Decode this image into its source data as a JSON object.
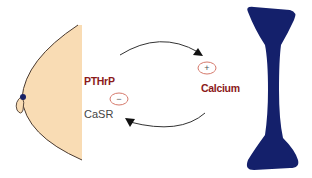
{
  "diagram": {
    "labels": {
      "pthrp": "PTHrP",
      "calcium": "Calcium",
      "casr": "CaSR"
    },
    "signs": {
      "negative": "−",
      "positive": "+"
    },
    "shapes": {
      "breast": {
        "fill": "#f9dcb4",
        "stroke": "#4a3a30",
        "nipple": "#1a2266"
      },
      "bone": {
        "fill": "#14206b"
      },
      "arrows": {
        "stroke": "#333333"
      },
      "sign_circle": {
        "stroke": "#d06a5a"
      }
    },
    "flow": [
      {
        "from": "breast",
        "to": "bone",
        "label": "PTHrP",
        "effect": "+"
      },
      {
        "from": "bone",
        "to": "breast",
        "label": "Calcium",
        "via": "CaSR",
        "effect": "−"
      }
    ]
  }
}
